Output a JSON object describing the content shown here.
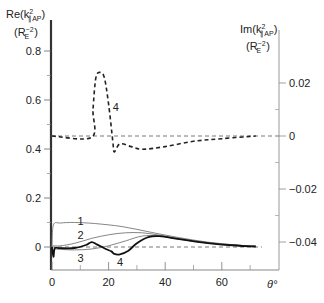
{
  "chart_data": {
    "type": "line",
    "title": "",
    "xlabel": "θ°",
    "ylabel_left": "Re(k²_∥AP) (R_E⁻²)",
    "ylabel_right": "Im(k²_∥AP) (R_E⁻²)",
    "xlim": [
      0,
      75
    ],
    "ylim_left": [
      -0.05,
      0.85
    ],
    "ylim_right": [
      -0.05,
      0.035
    ],
    "x_ticks": [
      0,
      20,
      40,
      60
    ],
    "x_minor_ticks": [
      10,
      30,
      50,
      70
    ],
    "y_left_ticks": [
      0,
      0.2,
      0.4,
      0.6,
      0.8
    ],
    "y_left_minor_ticks": [
      0.1,
      0.3,
      0.5,
      0.7
    ],
    "y_right_ticks": [
      0.02,
      0,
      -0.02,
      -0.04
    ],
    "y_right_minor_ticks": [
      0.01,
      -0.01,
      -0.03
    ],
    "grid": false,
    "reference_lines": [
      {
        "axis": "left",
        "y": 0,
        "style": "dashed"
      },
      {
        "axis": "right",
        "y": 0,
        "style": "dashed"
      }
    ],
    "series": [
      {
        "name": "1",
        "axis": "left",
        "style": "thin-solid",
        "x": [
          0,
          0.5,
          3,
          8,
          15,
          25,
          35,
          45,
          55,
          65,
          72
        ],
        "y": [
          0,
          0.09,
          0.098,
          0.1,
          0.096,
          0.083,
          0.06,
          0.038,
          0.02,
          0.008,
          0.003
        ]
      },
      {
        "name": "2",
        "axis": "left",
        "style": "thin-solid",
        "x": [
          0,
          0.5,
          3,
          8,
          14,
          20,
          26,
          32,
          38,
          45,
          55,
          65,
          72
        ],
        "y": [
          0,
          0.005,
          0.005,
          0.015,
          0.035,
          0.05,
          0.058,
          0.058,
          0.048,
          0.035,
          0.018,
          0.008,
          0.003
        ]
      },
      {
        "name": "3",
        "axis": "left",
        "style": "thin-solid",
        "x": [
          0,
          0.5,
          1,
          3,
          8,
          14,
          20,
          26,
          32,
          38,
          45,
          55,
          65,
          72
        ],
        "y": [
          0,
          -0.03,
          -0.01,
          -0.01,
          -0.012,
          -0.008,
          0.005,
          0.025,
          0.045,
          0.045,
          0.032,
          0.016,
          0.007,
          0.003
        ]
      },
      {
        "name": "4",
        "axis": "left",
        "style": "thick-solid",
        "x": [
          0,
          0.5,
          1,
          3,
          8,
          12,
          14,
          16,
          19,
          21,
          22,
          24,
          27,
          30,
          34,
          38,
          45,
          55,
          65,
          72
        ],
        "y": [
          0,
          -0.04,
          -0.005,
          -0.005,
          -0.004,
          0.008,
          0.02,
          0.01,
          -0.008,
          -0.018,
          -0.028,
          -0.03,
          -0.015,
          0.015,
          0.04,
          0.044,
          0.032,
          0.016,
          0.006,
          0.002
        ]
      },
      {
        "name": "4",
        "axis": "right",
        "style": "thick-dashed",
        "x": [
          0,
          14,
          14.5,
          15.5,
          17,
          18.5,
          20,
          21.5,
          22,
          24,
          28,
          32,
          40,
          50,
          60,
          72
        ],
        "y": [
          0,
          -0.0005,
          0.01,
          0.022,
          0.024,
          0.022,
          0.012,
          -0.002,
          -0.006,
          -0.003,
          -0.004,
          -0.005,
          -0.004,
          -0.002,
          -0.001,
          0
        ]
      }
    ],
    "curve_labels": [
      {
        "text": "1",
        "x": 9,
        "y": 0.105
      },
      {
        "text": "2",
        "x": 9,
        "y": 0.048
      },
      {
        "text": "3",
        "x": 9,
        "y": -0.045
      },
      {
        "text": "4",
        "x": 23,
        "y": -0.06
      },
      {
        "text": "4",
        "x": 21.5,
        "y_right": 0.011
      }
    ]
  },
  "labels": {
    "left_axis_main": "Re(k",
    "left_axis_sup": "2",
    "left_axis_sub": "∥AP",
    "left_axis_close": ")",
    "left_axis_unit": "(R",
    "left_axis_unit_sub": "E",
    "left_axis_unit_sup": "−2",
    "left_axis_unit_close": ")",
    "right_axis_main": "Im(k",
    "right_axis_sup": "2",
    "right_axis_sub": "∥AP",
    "right_axis_close": ")",
    "right_axis_unit": "(R",
    "right_axis_unit_sub": "E",
    "right_axis_unit_sup": "−2",
    "right_axis_unit_close": ")",
    "x_axis": "θ°"
  },
  "ticks": {
    "x": [
      "0",
      "20",
      "40",
      "60"
    ],
    "left": [
      "0",
      "0.2",
      "0.4",
      "0.6",
      "0.8"
    ],
    "right": [
      "0.02",
      "0",
      "−0.02",
      "−0.04"
    ]
  }
}
